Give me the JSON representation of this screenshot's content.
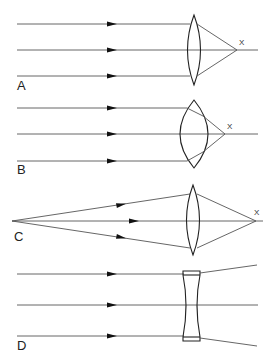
{
  "diagram": {
    "colors": {
      "background": "#ffffff",
      "ray": "#555555",
      "lens": "#222222",
      "arrow": "#111111"
    },
    "panels": [
      {
        "id": "A",
        "label": "A",
        "lens_type": "convex-thin",
        "incoming": "parallel",
        "focus_label": "X"
      },
      {
        "id": "B",
        "label": "B",
        "lens_type": "convex-thick",
        "incoming": "parallel",
        "focus_label": "X"
      },
      {
        "id": "C",
        "label": "C",
        "lens_type": "convex-thin",
        "incoming": "diverging-from-point",
        "focus_label": "X"
      },
      {
        "id": "D",
        "label": "D",
        "lens_type": "concave",
        "incoming": "parallel",
        "focus_label": ""
      }
    ]
  }
}
